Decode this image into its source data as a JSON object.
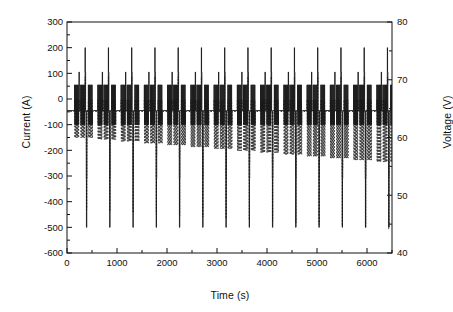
{
  "chart_data": {
    "type": "line",
    "title": "",
    "xlabel": "Time (s)",
    "ylabel": "Current (A)",
    "y2label": "Voltage (V)",
    "xlim": [
      0,
      6500
    ],
    "ylim": [
      -600,
      300
    ],
    "y2lim": [
      40,
      80
    ],
    "xticks": [
      0,
      1000,
      2000,
      3000,
      4000,
      5000,
      6000
    ],
    "xtick_labels": [
      "0",
      "1000",
      "2000",
      "3000",
      "4000",
      "5000",
      "6000"
    ],
    "xminor_step": 500,
    "yticks": [
      -600,
      -500,
      -400,
      -300,
      -200,
      -100,
      0,
      100,
      200,
      300
    ],
    "ytick_labels": [
      "-600",
      "-500",
      "-400",
      "-300",
      "-200",
      "-100",
      "0",
      "100",
      "200",
      "300"
    ],
    "yminor_step": 50,
    "y2ticks": [
      40,
      50,
      60,
      70,
      80
    ],
    "y2tick_labels": [
      "40",
      "50",
      "60",
      "70",
      "80"
    ],
    "y2minor_step": 5,
    "grid": false,
    "legend": "none",
    "frame": true,
    "series": [
      {
        "name": "Current (A)",
        "axis": "left",
        "style": "solid",
        "color": "#1a1a1a",
        "cycles": 14,
        "cycle_period_s": 465,
        "cycle_start_s": 150,
        "description": "Repeating duty cycle: dense train of short pulses between -100 A and +55 A, one tall charge spike to +200 A, one deep discharge spike to -500 A at end of each cycle.",
        "pulse_levels": {
          "baseline_a": -45,
          "small_pulse_high_a": 55,
          "small_pulse_low_a": -100,
          "mid_pulse_a": 105,
          "tall_spike_a": 200,
          "deep_spike_a": -500,
          "shoulder_a": -310
        },
        "small_pulses_per_group": 5,
        "groups_per_cycle": 3
      },
      {
        "name": "Voltage (V)",
        "axis": "right",
        "style": "dashed",
        "color": "#2b2b2b",
        "cycles": 14,
        "description": "Dashed voltage trace oscillating about 62-66 V with pulse-synchronous dips; envelope drifts downward over the run, minimum dipping from ~60 V early to ~56 V late, with deep sags to ~44-48 V coincident with the discharge spikes.",
        "levels": {
          "nominal_v": 64.5,
          "pulse_high_v": 66.5,
          "pulse_low_start_v": 60.0,
          "pulse_low_end_v": 55.8,
          "deep_sag_start_v": 47.5,
          "deep_sag_end_v": 44.2
        }
      }
    ]
  },
  "axes": {
    "left_title": "Current (A)",
    "right_title": "Voltage (V)",
    "bottom_title": "Time (s)"
  }
}
